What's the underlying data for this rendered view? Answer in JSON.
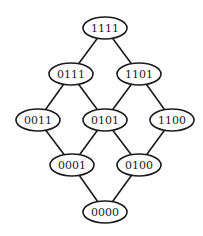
{
  "diagram": {
    "type": "lattice",
    "nodes": [
      {
        "id": "1111",
        "label": "1111",
        "cx": 105,
        "cy": 28
      },
      {
        "id": "0111",
        "label": "0111",
        "cx": 71,
        "cy": 74
      },
      {
        "id": "1101",
        "label": "1101",
        "cx": 139,
        "cy": 74
      },
      {
        "id": "0011",
        "label": "0011",
        "cx": 38,
        "cy": 120
      },
      {
        "id": "0101",
        "label": "0101",
        "cx": 105,
        "cy": 120
      },
      {
        "id": "1100",
        "label": "1100",
        "cx": 172,
        "cy": 120
      },
      {
        "id": "0001",
        "label": "0001",
        "cx": 72,
        "cy": 165
      },
      {
        "id": "0100",
        "label": "0100",
        "cx": 139,
        "cy": 165
      },
      {
        "id": "0000",
        "label": "0000",
        "cx": 105,
        "cy": 212
      }
    ],
    "edges": [
      [
        "1111",
        "0111"
      ],
      [
        "1111",
        "1101"
      ],
      [
        "0111",
        "0011"
      ],
      [
        "0111",
        "0101"
      ],
      [
        "1101",
        "0101"
      ],
      [
        "1101",
        "1100"
      ],
      [
        "0011",
        "0001"
      ],
      [
        "0101",
        "0001"
      ],
      [
        "0101",
        "0100"
      ],
      [
        "1100",
        "0100"
      ],
      [
        "0001",
        "0000"
      ],
      [
        "0100",
        "0000"
      ]
    ],
    "node_rx": 22,
    "node_ry": 11
  }
}
